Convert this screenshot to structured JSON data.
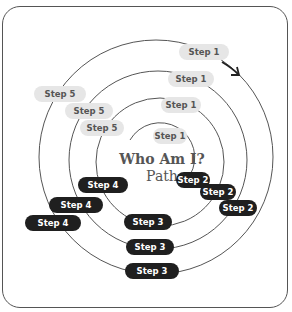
{
  "diagram": {
    "title_line1": "Who Am I?",
    "title_line2": "Path",
    "colors": {
      "light_pill": "#e6e6e6",
      "dark_pill": "#1f1f1f",
      "ring": "#555555",
      "title": "#555555"
    },
    "steps": {
      "ring1_step1": "Step 1",
      "ring2_step1": "Step 1",
      "ring3_step1": "Step 1",
      "ring4_step1": "Step 1",
      "ring1_step2": "Step 2",
      "ring2_step2": "Step 2",
      "ring3_step2": "Step 2",
      "ring1_step3": "Step 3",
      "ring2_step3": "Step 3",
      "ring3_step3": "Step 3",
      "ring1_step4": "Step 4",
      "ring2_step4": "Step 4",
      "ring3_step4": "Step 4",
      "ring2_step5": "Step 5",
      "ring3_step5": "Step 5",
      "ring4_step5": "Step 5"
    },
    "arrow_icon": "curved-arrow"
  }
}
